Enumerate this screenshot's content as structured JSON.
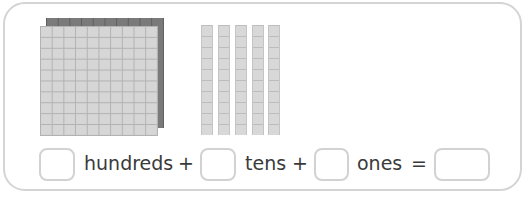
{
  "worksheet": {
    "blocks": {
      "hundreds_flats": 1,
      "tens_rods": 5,
      "ones_units": 0
    },
    "equation": {
      "hundreds_label": "hundreds",
      "plus1": "+",
      "tens_label": "tens",
      "plus2": "+",
      "ones_label": "ones",
      "equals": "=",
      "hundreds_value": "",
      "tens_value": "",
      "ones_value": "",
      "total_value": ""
    },
    "colors": {
      "frame_border": "#d4d4d4",
      "block_fill": "#d6d6d6",
      "block_shadow": "#7a7a7a",
      "text": "#3a3a3a"
    }
  }
}
